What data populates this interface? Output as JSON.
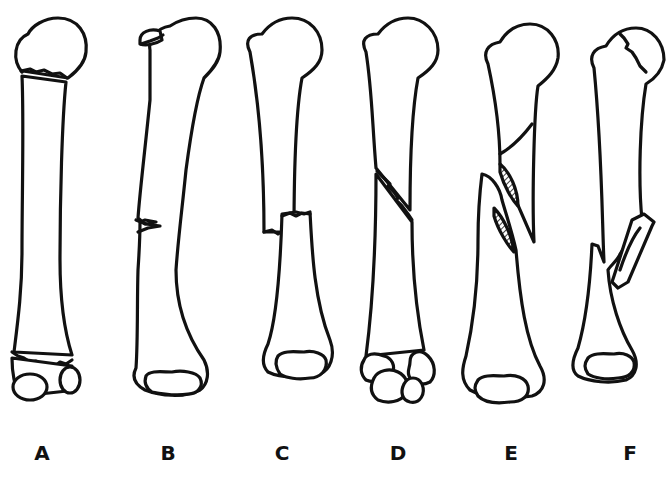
{
  "figure": {
    "background_color": "#ffffff",
    "line_color": "#111111",
    "panels": [
      {
        "id": "A",
        "label": "A",
        "center_x": 42
      },
      {
        "id": "B",
        "label": "B",
        "center_x": 168
      },
      {
        "id": "C",
        "label": "C",
        "center_x": 282
      },
      {
        "id": "D",
        "label": "D",
        "center_x": 398
      },
      {
        "id": "E",
        "label": "E",
        "center_x": 511
      },
      {
        "id": "F",
        "label": "F",
        "center_x": 630
      }
    ]
  }
}
